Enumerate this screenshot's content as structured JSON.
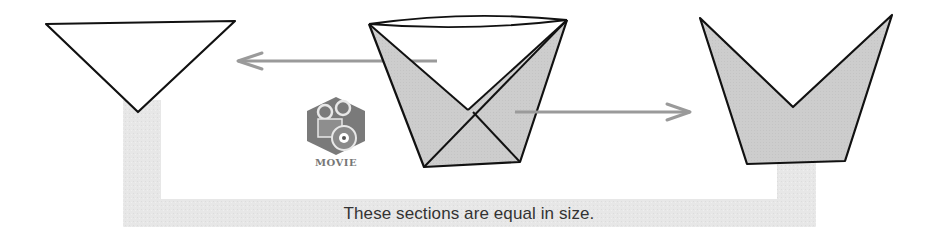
{
  "diagram": {
    "caption": "These sections are equal in size.",
    "movie_badge": {
      "label": "MOVIE",
      "icon": "movie-film-reel-disc-icon"
    },
    "colors": {
      "outline": "#111111",
      "shaded_fill": "#cfcfcf",
      "band_fill": "#e6e6e6",
      "arrow": "#9a9a9a",
      "caption_text": "#333333"
    },
    "shapes": [
      {
        "name": "left-triangle-section",
        "fill": "white"
      },
      {
        "name": "center-folded-cup",
        "fill": "partially shaded"
      },
      {
        "name": "right-crown-section",
        "fill": "shaded"
      }
    ],
    "arrows": [
      {
        "name": "arrow-to-left-section",
        "direction": "left"
      },
      {
        "name": "arrow-to-right-section",
        "direction": "right"
      }
    ]
  }
}
